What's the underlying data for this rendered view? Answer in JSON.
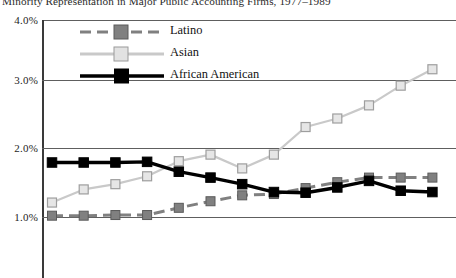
{
  "chart_title": "Minority Representation in Major Public Accounting Firms, 1977–1989",
  "legend": {
    "position": "top-left-inside",
    "items": [
      {
        "label": "Latino",
        "color": "#808080",
        "marker": "square",
        "line_style": "dashed",
        "marker_fill": "#808080",
        "marker_edge": "#5a5a5a"
      },
      {
        "label": "Asian",
        "color": "#c9c9c9",
        "marker": "square",
        "line_style": "solid",
        "marker_fill": "#e2e2e2",
        "marker_edge": "#9a9a9a"
      },
      {
        "label": "African American",
        "color": "#000000",
        "marker": "square",
        "line_style": "solid",
        "marker_fill": "#000000",
        "marker_edge": "#000000"
      }
    ]
  },
  "axis": {
    "y_ticks": [
      "4.0%",
      "3.0%",
      "2.0%",
      "1.0%"
    ],
    "y_tick_values": [
      4.0,
      3.0,
      2.0,
      1.0
    ],
    "y_min": 0.25,
    "y_max": 4.0,
    "gridlines": true,
    "x_labels_visible": false
  },
  "chart_data": {
    "type": "line",
    "title": "Minority Representation in Major Public Accounting Firms, 1977–1989",
    "xlabel": "",
    "ylabel": "",
    "ylim": [
      0.25,
      4.0
    ],
    "grid": true,
    "legend_position": "top-left-inside",
    "categories": [
      "1977",
      "1978",
      "1979",
      "1980",
      "1981",
      "1982",
      "1983",
      "1984",
      "1985",
      "1986",
      "1987",
      "1988",
      "1989"
    ],
    "series": [
      {
        "name": "Latino",
        "color": "#808080",
        "line_style": "dashed",
        "values": [
          1.02,
          1.02,
          1.03,
          1.03,
          1.14,
          1.24,
          1.33,
          1.35,
          1.44,
          1.53,
          1.6,
          1.6,
          1.6
        ]
      },
      {
        "name": "Asian",
        "color": "#c9c9c9",
        "line_style": "solid",
        "values": [
          1.22,
          1.42,
          1.5,
          1.62,
          1.85,
          1.95,
          1.74,
          1.95,
          2.37,
          2.5,
          2.7,
          3.0,
          3.25
        ]
      },
      {
        "name": "African American",
        "color": "#000000",
        "line_style": "solid",
        "values": [
          1.83,
          1.83,
          1.83,
          1.84,
          1.69,
          1.6,
          1.5,
          1.38,
          1.37,
          1.45,
          1.55,
          1.4,
          1.38
        ]
      }
    ]
  }
}
